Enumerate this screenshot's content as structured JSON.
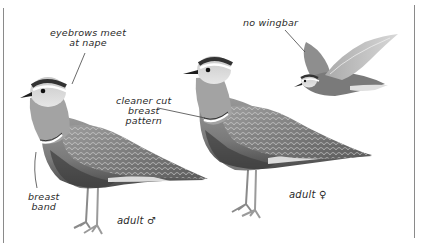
{
  "figure": {
    "annotations": {
      "eyebrows": [
        "eyebrows meet",
        "at nape"
      ],
      "wingbar": "no wingbar",
      "breast_pattern": [
        "cleaner cut",
        "breast",
        "pattern"
      ],
      "breast_band": [
        "breast",
        "band"
      ],
      "male_caption": "adult ♂",
      "female_caption": "adult ♀"
    },
    "birds": [
      {
        "id": "adult-male",
        "pose": "standing"
      },
      {
        "id": "adult-female",
        "pose": "standing"
      },
      {
        "id": "flight",
        "pose": "flying"
      }
    ],
    "colors": {
      "background": "#ffffff",
      "frame": "#8a8a8a",
      "ink": "#2a2a2a",
      "plumage_dark": "#3e3e3e",
      "plumage_mid": "#8c8c8c",
      "plumage_light": "#cfcfcf"
    }
  }
}
